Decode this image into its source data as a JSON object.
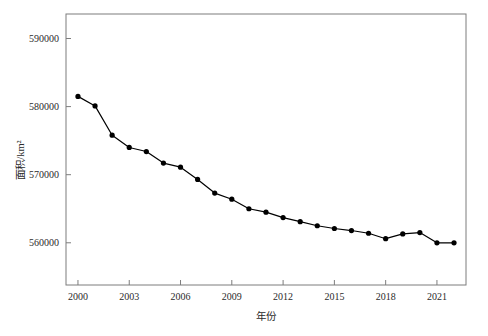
{
  "chart_data": {
    "type": "line",
    "title": "",
    "subtitle": "",
    "xlabel": "年份",
    "ylabel": "面积/km²",
    "x": [
      2000,
      2001,
      2002,
      2003,
      2004,
      2005,
      2006,
      2007,
      2008,
      2009,
      2010,
      2011,
      2012,
      2013,
      2014,
      2015,
      2016,
      2017,
      2018,
      2019,
      2020,
      2021,
      2022
    ],
    "values": [
      581500,
      580100,
      575800,
      574000,
      573400,
      571700,
      571100,
      569300,
      567300,
      566400,
      565000,
      564500,
      563700,
      563100,
      562500,
      562100,
      561800,
      561400,
      560600,
      561300,
      561500,
      560000,
      560000
    ],
    "series": [
      {
        "name": "面积",
        "values": [
          581500,
          580100,
          575800,
          574000,
          573400,
          571700,
          571100,
          569300,
          567300,
          566400,
          565000,
          564500,
          563700,
          563100,
          562500,
          562100,
          561800,
          561400,
          560600,
          561300,
          561500,
          560000,
          560000
        ]
      }
    ],
    "xlim": [
      1999.3,
      2022.7
    ],
    "ylim": [
      553800,
      593600
    ],
    "xticks": [
      2000,
      2003,
      2006,
      2009,
      2012,
      2015,
      2018,
      2021
    ],
    "xtick_labels": [
      "2000",
      "2003",
      "2006",
      "2009",
      "2012",
      "2015",
      "2018",
      "2021"
    ],
    "yticks": [
      560000,
      570000,
      580000,
      590000
    ],
    "ytick_labels": [
      "560000",
      "570000",
      "580000",
      "590000"
    ],
    "grid": false,
    "legend": "none",
    "line_color": "#000000",
    "marker_color": "#000000",
    "marker_shape": "circle",
    "frame_color": "#7d7d7d",
    "background_color": "#ffffff",
    "annotations": []
  }
}
